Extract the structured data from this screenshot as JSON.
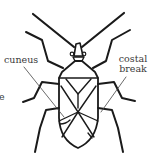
{
  "figure": {
    "labels": {
      "cuneus": "cuneus",
      "costal_line1": "costal",
      "costal_line2": "break",
      "edge_fragment": "e"
    },
    "colors": {
      "line": "#1a1a1a",
      "label_text": "#3a3a3a",
      "background": "#ffffff"
    }
  }
}
